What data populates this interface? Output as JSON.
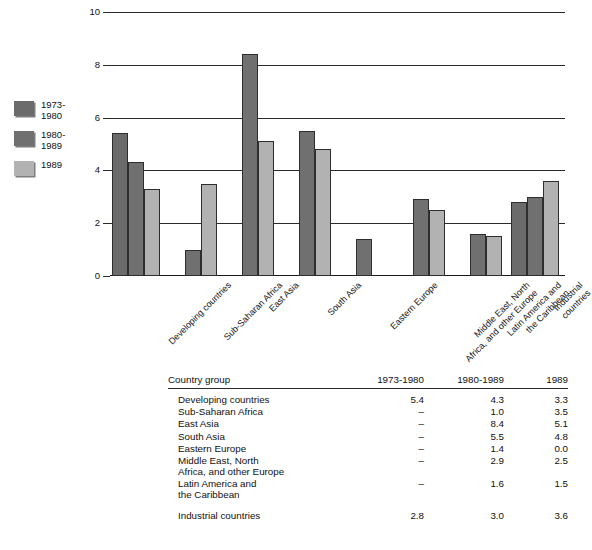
{
  "chart_data": {
    "type": "bar",
    "title": "",
    "xlabel": "",
    "ylabel": "",
    "ylim": [
      0,
      10
    ],
    "yticks": [
      "0",
      "2",
      "4",
      "6",
      "8",
      "10"
    ],
    "grid": true,
    "legend_position": "left",
    "categories": [
      "Developing countries",
      "Sub-Saharan Africa",
      "East Asia",
      "South Asia",
      "Eastern Europe",
      "Middle East, North\nAfrica, and other Europe",
      "Latin America and\nthe Caribbean",
      "Industrial countries"
    ],
    "series": [
      {
        "name": "1973-\n1980",
        "color": "#6b6b6b",
        "values": [
          5.4,
          null,
          null,
          null,
          null,
          null,
          null,
          2.8
        ]
      },
      {
        "name": "1980-\n1989",
        "color": "#707070",
        "values": [
          4.3,
          1.0,
          8.4,
          5.5,
          1.4,
          2.9,
          1.6,
          3.0
        ]
      },
      {
        "name": "1989",
        "color": "#b2b2b2",
        "values": [
          3.3,
          3.5,
          5.1,
          4.8,
          0.0,
          2.5,
          1.5,
          3.6
        ]
      }
    ]
  },
  "legend": {
    "items": [
      {
        "label": "1973-\n1980",
        "color": "#6b6b6b"
      },
      {
        "label": "1980-\n1989",
        "color": "#707070"
      },
      {
        "label": "1989",
        "color": "#b2b2b2"
      }
    ]
  },
  "table": {
    "headers": {
      "group": "Country group",
      "col1": "1973-1980",
      "col2": "1980-1989",
      "col3": "1989"
    },
    "dash": "–",
    "rows": [
      {
        "name": "Developing countries",
        "c1": "5.4",
        "c2": "4.3",
        "c3": "3.3",
        "spaced": false
      },
      {
        "name": "Sub-Saharan Africa",
        "c1": "–",
        "c2": "1.0",
        "c3": "3.5",
        "spaced": false
      },
      {
        "name": "East Asia",
        "c1": "–",
        "c2": "8.4",
        "c3": "5.1",
        "spaced": false
      },
      {
        "name": "South Asia",
        "c1": "–",
        "c2": "5.5",
        "c3": "4.8",
        "spaced": false
      },
      {
        "name": "Eastern Europe",
        "c1": "–",
        "c2": "1.4",
        "c3": "0.0",
        "spaced": false
      },
      {
        "name": "Middle East, North\n   Africa, and other Europe",
        "c1": "–",
        "c2": "2.9",
        "c3": "2.5",
        "spaced": false
      },
      {
        "name": "Latin America and\n   the Caribbean",
        "c1": "–",
        "c2": "1.6",
        "c3": "1.5",
        "spaced": false
      },
      {
        "name": "Industrial countries",
        "c1": "2.8",
        "c2": "3.0",
        "c3": "3.6",
        "spaced": true
      }
    ]
  }
}
